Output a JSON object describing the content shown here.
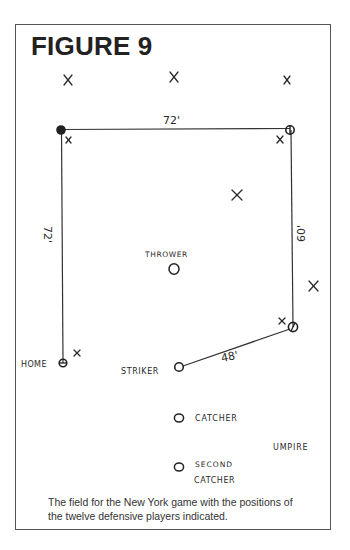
{
  "figure": {
    "title": "FIGURE 9",
    "caption_lines": [
      "The field for the New York game with the positions of",
      "the twelve defensive players indicated."
    ]
  },
  "field": {
    "bases": [
      {
        "name": "home",
        "x": 63,
        "y": 363
      },
      {
        "name": "first-base-top-left",
        "x": 61,
        "y": 130
      },
      {
        "name": "second-base-top-right",
        "x": 290,
        "y": 130
      },
      {
        "name": "third-base-bottom-right",
        "x": 293,
        "y": 327
      },
      {
        "name": "striker",
        "x": 179,
        "y": 367
      }
    ],
    "distances": {
      "top": "72'",
      "left": "72'",
      "right": "60'",
      "striker_to_base": "48'"
    },
    "labels": {
      "home": "HOME",
      "striker": "STRIKER",
      "thrower": "THROWER",
      "catcher": "CATCHER",
      "second_catcher_line1": "SECOND",
      "second_catcher_line2": "CATCHER",
      "umpire": "UMPIRE"
    },
    "fielders_x": [
      {
        "x": 68,
        "y": 80
      },
      {
        "x": 174,
        "y": 77
      },
      {
        "x": 287,
        "y": 80
      },
      {
        "x": 68,
        "y": 140
      },
      {
        "x": 280,
        "y": 139
      },
      {
        "x": 237,
        "y": 195
      },
      {
        "x": 314,
        "y": 286
      },
      {
        "x": 282,
        "y": 321
      },
      {
        "x": 77,
        "y": 353
      }
    ],
    "players_o": [
      {
        "role": "thrower",
        "x": 174,
        "y": 269
      },
      {
        "role": "catcher",
        "x": 179,
        "y": 418
      },
      {
        "role": "second-catcher",
        "x": 179,
        "y": 467
      }
    ],
    "line_color": "#333333"
  }
}
